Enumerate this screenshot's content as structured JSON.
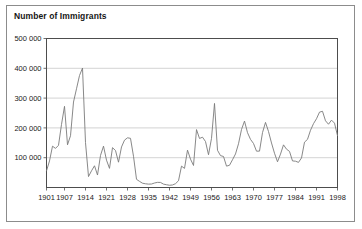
{
  "chart_data": {
    "type": "line",
    "title": "Number of Immigrants",
    "xlabel": "",
    "ylabel": "",
    "grid": true,
    "legend": false,
    "xlim": [
      1901,
      1998
    ],
    "ylim": [
      0,
      500000
    ],
    "ytick_labels": [
      "500 000",
      "400 000",
      "300 000",
      "200 000",
      "100 000"
    ],
    "ytick_values": [
      500000,
      400000,
      300000,
      200000,
      100000
    ],
    "xtick_labels": [
      "1901",
      "1907",
      "1914",
      "1921",
      "1928",
      "1935",
      "1942",
      "1949",
      "1956",
      "1963",
      "1970",
      "1977",
      "1984",
      "1991",
      "1998"
    ],
    "xtick_values": [
      1901,
      1907,
      1914,
      1921,
      1928,
      1935,
      1942,
      1949,
      1956,
      1963,
      1970,
      1977,
      1984,
      1991,
      1998
    ],
    "line_color": "#7a7a7a",
    "grid_color": "#c8c8c8",
    "axis_color": "#4d4d4d",
    "x": [
      1901,
      1902,
      1903,
      1904,
      1905,
      1906,
      1907,
      1908,
      1909,
      1910,
      1911,
      1912,
      1913,
      1914,
      1915,
      1916,
      1917,
      1918,
      1919,
      1920,
      1921,
      1922,
      1923,
      1924,
      1925,
      1926,
      1927,
      1928,
      1929,
      1930,
      1931,
      1932,
      1933,
      1934,
      1935,
      1936,
      1937,
      1938,
      1939,
      1940,
      1941,
      1942,
      1943,
      1944,
      1945,
      1946,
      1947,
      1948,
      1949,
      1950,
      1951,
      1952,
      1953,
      1954,
      1955,
      1956,
      1957,
      1958,
      1959,
      1960,
      1961,
      1962,
      1963,
      1964,
      1965,
      1966,
      1967,
      1968,
      1969,
      1970,
      1971,
      1972,
      1973,
      1974,
      1975,
      1976,
      1977,
      1978,
      1979,
      1980,
      1981,
      1982,
      1983,
      1984,
      1985,
      1986,
      1987,
      1988,
      1989,
      1990,
      1991,
      1992,
      1993,
      1994,
      1995,
      1996,
      1997,
      1998
    ],
    "values": [
      55747,
      89102,
      138660,
      131252,
      141465,
      211653,
      272409,
      143326,
      173694,
      286839,
      331288,
      375756,
      400870,
      150484,
      36665,
      55914,
      72910,
      41845,
      107698,
      138824,
      91728,
      64224,
      133729,
      124164,
      84907,
      135982,
      158886,
      166783,
      164993,
      104806,
      27530,
      20591,
      14382,
      12476,
      11277,
      11643,
      15101,
      17244,
      16994,
      11324,
      9329,
      7576,
      8504,
      12801,
      22722,
      71719,
      64127,
      125414,
      95217,
      73912,
      194391,
      164498,
      168868,
      154227,
      109946,
      164857,
      282164,
      124851,
      106928,
      104111,
      71689,
      74586,
      93151,
      112606,
      146758,
      194743,
      222876,
      183974,
      161531,
      147713,
      121900,
      122006,
      184200,
      218465,
      187881,
      149429,
      114914,
      86313,
      112096,
      143117,
      128618,
      121147,
      89157,
      88239,
      84302,
      99219,
      152098,
      161584,
      192001,
      214230,
      230781,
      252842,
      255819,
      223875,
      212270,
      226071,
      216014,
      174100
    ]
  }
}
